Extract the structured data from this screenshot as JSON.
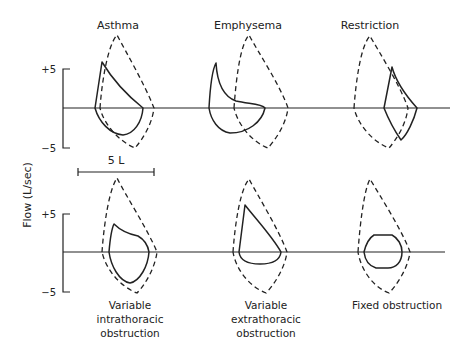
{
  "figure": {
    "y_axis_label": "Flow (L/sec)",
    "scale_bar_label": "5 L",
    "ticks": {
      "top_plus": "+5",
      "top_minus": "−5",
      "bottom_plus": "+5",
      "bottom_minus": "−5"
    },
    "panels": {
      "asthma": {
        "title": "Asthma"
      },
      "emphysema": {
        "title": "Emphysema"
      },
      "restriction": {
        "title": "Restriction"
      },
      "intrathoracic": {
        "caption_lines": [
          "Variable",
          "intrathoracic",
          "obstruction"
        ]
      },
      "extrathoracic": {
        "caption_lines": [
          "Variable",
          "extrathoracic",
          "obstruction"
        ]
      },
      "fixed": {
        "caption_lines": [
          "Fixed obstruction"
        ]
      }
    },
    "legend_semantics": {
      "dashed_curve": "normal flow-volume loop",
      "solid_curve": "disease flow-volume loop"
    },
    "colors": {
      "ink": "#222222",
      "background": "#ffffff"
    }
  }
}
